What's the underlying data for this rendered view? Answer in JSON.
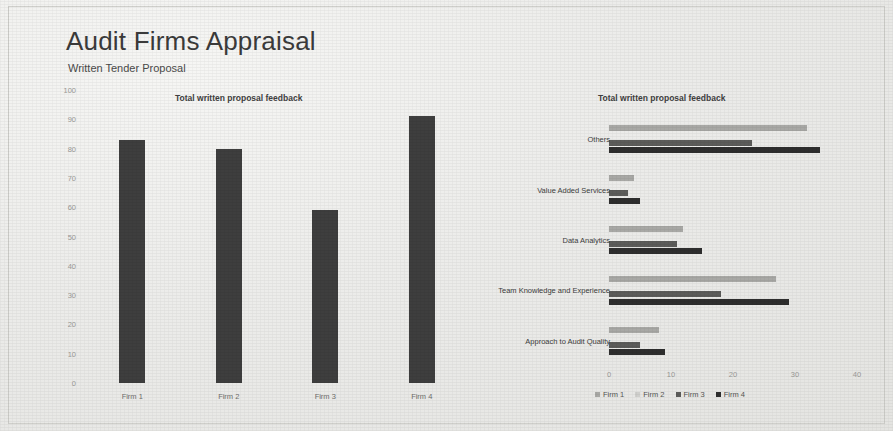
{
  "slide": {
    "title": "Audit Firms Appraisal",
    "subtitle": "Written Tender Proposal"
  },
  "chart_data": [
    {
      "type": "bar",
      "orientation": "vertical",
      "title": "Total written proposal feedback",
      "categories": [
        "Firm 1",
        "Firm 2",
        "Firm 3",
        "Firm 4"
      ],
      "values": [
        83,
        80,
        59,
        91
      ],
      "xlabel": "",
      "ylabel": "",
      "ylim": [
        0,
        100
      ],
      "yticks": [
        0,
        10,
        20,
        30,
        40,
        50,
        60,
        70,
        80,
        90,
        100
      ],
      "grid": false,
      "legend": "none",
      "bar_color": "#3e3e3e"
    },
    {
      "type": "bar",
      "orientation": "horizontal",
      "title": "Total written proposal feedback",
      "categories": [
        "Approach to Audit Quality",
        "Team Knowledge and Experience",
        "Data Analytics",
        "Value Added Services",
        "Others"
      ],
      "series": [
        {
          "name": "Firm 1",
          "color": "#a8a8a5",
          "values": [
            8,
            27,
            12,
            4,
            32
          ]
        },
        {
          "name": "Firm 2",
          "color": "#cfcfcc",
          "values": [
            0,
            0,
            0,
            0,
            0
          ]
        },
        {
          "name": "Firm 3",
          "color": "#5c5c5a",
          "values": [
            5,
            18,
            11,
            3,
            23
          ]
        },
        {
          "name": "Firm 4",
          "color": "#2e2e2e",
          "values": [
            9,
            29,
            15,
            5,
            34
          ]
        }
      ],
      "xlabel": "",
      "ylabel": "",
      "xlim": [
        0,
        40
      ],
      "xticks": [
        0,
        10,
        20,
        30,
        40
      ],
      "grid": false,
      "legend_position": "bottom",
      "legend_entries": [
        "Firm 1",
        "Firm 2",
        "Firm 3",
        "Firm 4"
      ]
    }
  ]
}
